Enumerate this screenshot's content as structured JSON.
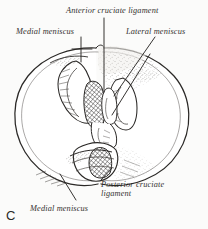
{
  "figure": {
    "letter": "C",
    "background_color": "#fbfbfa",
    "ink_color": "#262422",
    "labels": [
      {
        "id": "anterior-cruciate-ligament",
        "text": "Anterior cruciate ligament",
        "name": "label-anterior-cruciate-ligament",
        "leader": "vertical line down to central intercondylar region"
      },
      {
        "id": "medial-meniscus-top",
        "text": "Medial meniscus",
        "name": "label-medial-meniscus-top",
        "leader": "vertical line with short horizontal crossbar at medial meniscus anterior horn"
      },
      {
        "id": "lateral-meniscus",
        "text": "Lateral meniscus",
        "name": "label-lateral-meniscus",
        "leader": "long diagonal line descending to the left toward lateral meniscus"
      },
      {
        "id": "posterior-cruciate-ligament",
        "text": "Posterior cruciate ligament",
        "line1": "Posterior cruciate",
        "line2": "ligament",
        "name": "label-posterior-cruciate-ligament",
        "leader": "diagonal line rising to the right from posterior intercondylar area"
      },
      {
        "id": "medial-meniscus-bottom",
        "text": "Medial meniscus",
        "name": "label-medial-meniscus-bottom",
        "leader": "diagonal line rising to the right toward posterior horn of medial meniscus"
      }
    ]
  }
}
